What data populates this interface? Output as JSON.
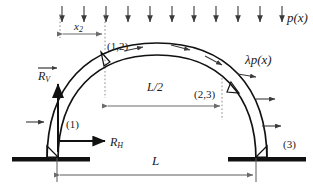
{
  "figure": {
    "kind": "structural-diagram",
    "background_color": "#ffffff",
    "line_color": "#1a1a1a",
    "dim_color": "#6b6b6b",
    "dotted_color": "#8c8c8c"
  },
  "loads": {
    "vertical_load_label": "p(x)",
    "vertical_arrow_count": 11,
    "tangential_load_label": "λp(x)",
    "tangential_arrow_count": 7
  },
  "reactions": {
    "vertical_label": "R",
    "vertical_sub": "V",
    "horizontal_label": "R",
    "horizontal_sub": "H"
  },
  "hinges": {
    "base_left": "(1)",
    "crown": "(1,2)",
    "right": "(2,3)",
    "base_right": "(3)"
  },
  "dimensions": {
    "x2_label": "x",
    "x2_sub": "2",
    "half_span_label": "L/2",
    "span_label": "L"
  }
}
